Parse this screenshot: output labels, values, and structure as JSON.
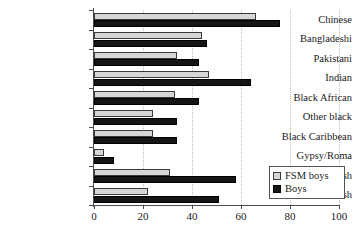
{
  "chart_data": {
    "type": "bar",
    "orientation": "horizontal",
    "title": "",
    "subtitle": "",
    "xlabel": "",
    "ylabel": "",
    "xlim": [
      0,
      100
    ],
    "xticks": [
      0,
      20,
      40,
      60,
      80,
      100
    ],
    "xtick_labels": [
      "0",
      "20",
      "40",
      "60",
      "80",
      "100"
    ],
    "grid": "vertical-dotted",
    "legend_position": "bottom-right",
    "categories": [
      "Chinese",
      "Bangladeshi",
      "Pakistani",
      "Indian",
      "Black African",
      "Other black",
      "Black Caribbean",
      "Gypsy/Roma",
      "Irish",
      "White British"
    ],
    "series": [
      {
        "name": "FSM boys",
        "color": "#d6d6d6",
        "values": [
          66,
          44,
          34,
          47,
          33,
          24,
          24,
          4,
          31,
          22
        ]
      },
      {
        "name": "Boys",
        "color": "#151515",
        "values": [
          76,
          46,
          43,
          64,
          43,
          34,
          34,
          8,
          58,
          51
        ]
      }
    ]
  },
  "legend": {
    "items": [
      {
        "label": "FSM boys",
        "swatch": "legend-swatch-fsm-boys"
      },
      {
        "label": "Boys",
        "swatch": "legend-swatch-boys"
      }
    ]
  }
}
